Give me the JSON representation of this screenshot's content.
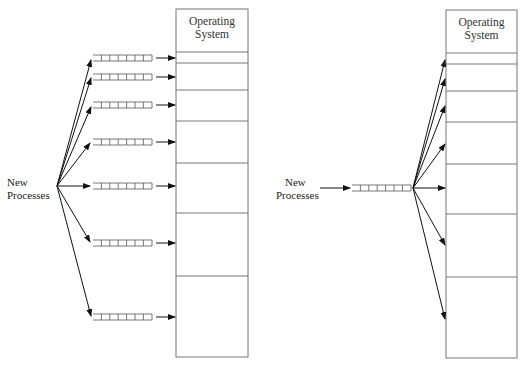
{
  "left_diagram": {
    "source_label_line1": "New",
    "source_label_line2": "Processes",
    "memory_header_line1": "Operating",
    "memory_header_line2": "System",
    "queue_count": 7,
    "partition_count": 7,
    "description": "Separate input queue for each memory partition"
  },
  "right_diagram": {
    "source_label_line1": "New",
    "source_label_line2": "Processes",
    "memory_header_line1": "Operating",
    "memory_header_line2": "System",
    "queue_count": 1,
    "partition_count": 7,
    "description": "Single input queue feeding all memory partitions"
  },
  "colors": {
    "line": "#222222",
    "box": "#777777",
    "text": "#222222"
  }
}
